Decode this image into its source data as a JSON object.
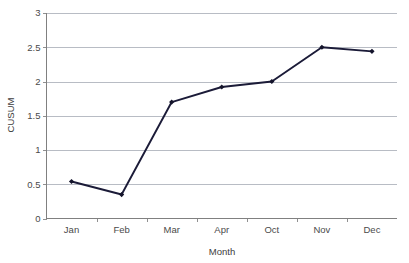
{
  "chart_data": {
    "type": "line",
    "title": "",
    "xlabel": "Month",
    "ylabel": "CUSUM",
    "categories": [
      "Jan",
      "Feb",
      "Mar",
      "Apr",
      "Oct",
      "Nov",
      "Dec"
    ],
    "values": [
      0.54,
      0.35,
      1.7,
      1.92,
      2.0,
      2.5,
      2.44
    ],
    "series": [
      {
        "name": "CUSUM",
        "values": [
          0.54,
          0.35,
          1.7,
          1.92,
          2.0,
          2.5,
          2.44
        ]
      }
    ],
    "ylim": [
      0,
      3
    ],
    "ytick_labels": [
      "0",
      "0.5",
      "1",
      "1.5",
      "2",
      "2.5",
      "3"
    ],
    "ytick_values": [
      0,
      0.5,
      1,
      1.5,
      2,
      2.5,
      3
    ],
    "grid": true,
    "grid_axis": "y",
    "legend": false,
    "legend_position": "none",
    "marker": "diamond",
    "colors": {
      "line": "#1b1b38",
      "marker": "#14142b",
      "gridline": "#b8bcc4",
      "axis": "#808080",
      "tick_text": "#4a4a4a",
      "axis_title": "#3d3d3d",
      "background": "#ffffff"
    }
  }
}
